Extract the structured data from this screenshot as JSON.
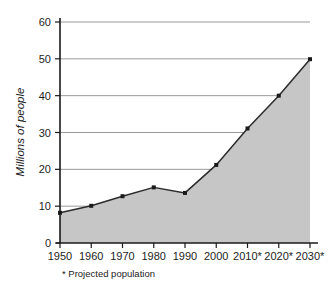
{
  "chart_data": {
    "type": "area",
    "title": "",
    "xlabel": "",
    "ylabel": "Millions of people",
    "categories": [
      "1950",
      "1960",
      "1970",
      "1980",
      "1990",
      "2000",
      "2010*",
      "2020*",
      "2030*"
    ],
    "values": [
      8.2,
      10.1,
      12.7,
      15.1,
      13.6,
      21.2,
      31.1,
      40.0,
      49.9
    ],
    "ylim": [
      0,
      60
    ],
    "y_ticks": [
      "0",
      "10",
      "20",
      "30",
      "40",
      "50",
      "60"
    ],
    "y_tick_values": [
      0,
      10,
      20,
      30,
      40,
      50,
      60
    ],
    "grid": true,
    "legend": "none",
    "footnote": "* Projected population",
    "colors": {
      "area_fill": "#c6c6c6",
      "line": "#2b2b2b",
      "marker": "#1a1a1a",
      "grid": "#8d8d8d",
      "axis": "#1a1a1a"
    }
  }
}
